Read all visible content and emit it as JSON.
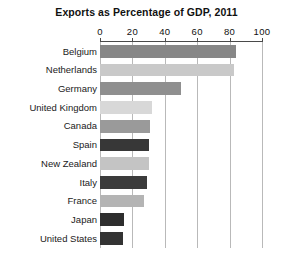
{
  "chart_data": {
    "type": "bar",
    "orientation": "horizontal",
    "title": "Exports as Percentage of GDP, 2011",
    "xlabel": "",
    "ylabel": "",
    "xlim": [
      0,
      100
    ],
    "xticks": [
      0,
      20,
      40,
      60,
      80,
      100
    ],
    "xtick_labels": [
      "0",
      "20",
      "40",
      "60",
      "80",
      "100"
    ],
    "grid": "vertical",
    "legend": "none",
    "categories": [
      "Belgium",
      "Netherlands",
      "Germany",
      "United Kingdom",
      "Canada",
      "Spain",
      "New Zealand",
      "Italy",
      "France",
      "Japan",
      "United States"
    ],
    "values": [
      84,
      83,
      50,
      32,
      31,
      30,
      30,
      29,
      27,
      15,
      14
    ],
    "bar_colors": [
      "#878787",
      "#c9c9c9",
      "#8f8f8f",
      "#d8d8d8",
      "#9a9a9a",
      "#373737",
      "#c4c4c4",
      "#3b3b3b",
      "#b4b4b4",
      "#2e2e2e",
      "#333333"
    ],
    "bars": [
      {
        "label": "Belgium",
        "value": 84,
        "color": "#878787"
      },
      {
        "label": "Netherlands",
        "value": 83,
        "color": "#c9c9c9"
      },
      {
        "label": "Germany",
        "value": 50,
        "color": "#8f8f8f"
      },
      {
        "label": "United Kingdom",
        "value": 32,
        "color": "#d8d8d8"
      },
      {
        "label": "Canada",
        "value": 31,
        "color": "#9a9a9a"
      },
      {
        "label": "Spain",
        "value": 30,
        "color": "#373737"
      },
      {
        "label": "New Zealand",
        "value": 30,
        "color": "#c4c4c4"
      },
      {
        "label": "Italy",
        "value": 29,
        "color": "#3b3b3b"
      },
      {
        "label": "France",
        "value": 27,
        "color": "#b4b4b4"
      },
      {
        "label": "Japan",
        "value": 15,
        "color": "#2e2e2e"
      },
      {
        "label": "United States",
        "value": 14,
        "color": "#333333"
      }
    ],
    "axis_color": "#4a4a4a",
    "gridline_color": "#b9b9b9",
    "background_color": "#ffffff"
  }
}
